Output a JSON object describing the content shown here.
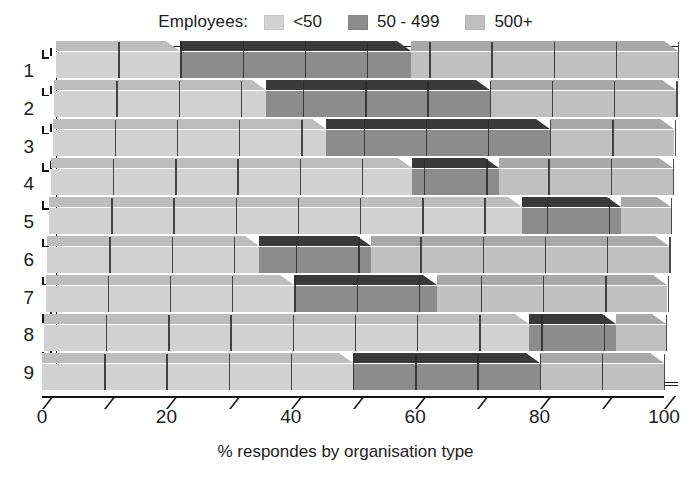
{
  "legend": {
    "title": "Employees:",
    "items": [
      {
        "label": "<50",
        "color": "#d2d2d2",
        "icon": "legend-swatch"
      },
      {
        "label": "50 - 499",
        "color": "#8c8c8c",
        "icon": "legend-swatch"
      },
      {
        "label": "500+",
        "color": "#c0c0c0",
        "icon": "legend-swatch"
      }
    ]
  },
  "chart_data": {
    "type": "bar",
    "orientation": "horizontal",
    "stacked": true,
    "three_d": true,
    "title": "",
    "xlabel": "% respondes by organisation type",
    "ylabel": "",
    "xlim": [
      0,
      100
    ],
    "xticks": [
      0,
      10,
      20,
      30,
      40,
      50,
      60,
      70,
      80,
      90,
      100
    ],
    "xticklabels": [
      "0",
      "20",
      "40",
      "60",
      "80",
      "100"
    ],
    "xticklabel_values": [
      0,
      20,
      40,
      60,
      80,
      100
    ],
    "grid": true,
    "legend_position": "top",
    "categories": [
      "1",
      "2",
      "3",
      "4",
      "5",
      "6",
      "7",
      "8",
      "9"
    ],
    "series": [
      {
        "name": "<50",
        "color": "#d2d2d2",
        "values": [
          20,
          34,
          44,
          58,
          76,
          34,
          40,
          78,
          50
        ]
      },
      {
        "name": "50 - 499",
        "color": "#8c8c8c",
        "values": [
          37,
          36,
          36,
          14,
          16,
          18,
          23,
          14,
          30
        ]
      },
      {
        "name": "500+",
        "color": "#c0c0c0",
        "values": [
          43,
          30,
          20,
          28,
          8,
          48,
          37,
          8,
          20
        ]
      }
    ],
    "cumulative_boundaries": [
      [
        20,
        57,
        100
      ],
      [
        34,
        70,
        100
      ],
      [
        44,
        80,
        100
      ],
      [
        58,
        72,
        100
      ],
      [
        76,
        92,
        100
      ],
      [
        34,
        52,
        100
      ],
      [
        40,
        63,
        100
      ],
      [
        78,
        92,
        100
      ],
      [
        50,
        80,
        100
      ]
    ]
  },
  "colors": {
    "segment_light": "#d2d2d2",
    "segment_dark": "#8c8c8c",
    "segment_medium": "#c0c0c0",
    "top_light": "#bdbdbd",
    "top_dark": "#3a3a3a",
    "top_medium": "#a8a8a8",
    "axis": "#141414",
    "background": "#ffffff"
  }
}
